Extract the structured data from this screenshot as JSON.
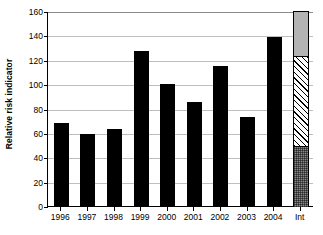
{
  "chart": {
    "type": "bar",
    "title": "",
    "ylabel": "Relative risk indicator",
    "xlabel": ""
  },
  "chart_data": {
    "type": "bar",
    "title": "",
    "xlabel": "",
    "ylabel": "Relative risk indicator",
    "ylim": [
      0,
      160
    ],
    "ytick_step": 20,
    "yticks": [
      0,
      20,
      40,
      60,
      80,
      100,
      120,
      140,
      160
    ],
    "ytick_labels": [
      "0",
      "20",
      "40",
      "60",
      "80",
      "100",
      "120",
      "140",
      "160"
    ],
    "grid": true,
    "grid_axis": "y",
    "legend": "none",
    "categories": [
      "1996",
      "1997",
      "1998",
      "1999",
      "2000",
      "2001",
      "2002",
      "2003",
      "2004",
      "Int"
    ],
    "series": [
      {
        "name": "Relative risk indicator",
        "color": "#000000",
        "values": [
          68,
          59,
          63,
          127,
          100,
          85,
          115,
          73,
          139,
          null
        ]
      }
    ],
    "stacked_bar": {
      "category": "Int",
      "total": 160,
      "segments": [
        {
          "name": "lower",
          "value": 49,
          "from": 0,
          "to": 49,
          "fill": "dark-gray-dotted",
          "color": "#8c8c8c"
        },
        {
          "name": "middle",
          "value": 74,
          "from": 49,
          "to": 123,
          "fill": "white-diagonal-hatch",
          "color": "#ffffff"
        },
        {
          "name": "upper",
          "value": 37,
          "from": 123,
          "to": 160,
          "fill": "light-gray-solid",
          "color": "#b3b3b3"
        }
      ]
    }
  },
  "axis": {
    "y_title": "Relative risk indicator",
    "y_ticks": [
      "160",
      "140",
      "120",
      "100",
      "80",
      "60",
      "40",
      "20",
      "0"
    ],
    "x_ticks": [
      "1996",
      "1997",
      "1998",
      "1999",
      "2000",
      "2001",
      "2002",
      "2003",
      "2004",
      "Int"
    ]
  }
}
